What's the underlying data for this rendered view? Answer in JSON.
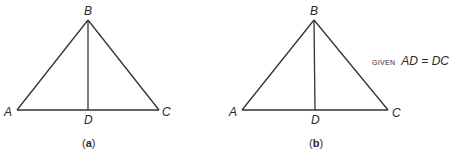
{
  "figures": [
    {
      "id": "a",
      "caption_open": "(",
      "caption_letter": "a",
      "caption_close": ")",
      "vertices": {
        "A": {
          "label": "A",
          "x": 17,
          "y": 110
        },
        "B": {
          "label": "B",
          "x": 88,
          "y": 20
        },
        "C": {
          "label": "C",
          "x": 159,
          "y": 110
        },
        "D": {
          "label": "D",
          "x": 88,
          "y": 110
        }
      },
      "segments": [
        "AB",
        "BC",
        "AC",
        "BD"
      ]
    },
    {
      "id": "b",
      "caption_open": "(",
      "caption_letter": "b",
      "caption_close": ")",
      "vertices": {
        "A": {
          "label": "A",
          "x": 242,
          "y": 110
        },
        "B": {
          "label": "B",
          "x": 314,
          "y": 20
        },
        "C": {
          "label": "C",
          "x": 388,
          "y": 110
        },
        "D": {
          "label": "D",
          "x": 315,
          "y": 110
        }
      },
      "segments": [
        "AB",
        "BC",
        "AC",
        "BD"
      ],
      "annotation": {
        "prefix": "GIVEN",
        "statement": "AD = DC"
      }
    }
  ],
  "colors": {
    "stroke": "#333333",
    "text": "#2a2a2a",
    "background": "#ffffff"
  }
}
